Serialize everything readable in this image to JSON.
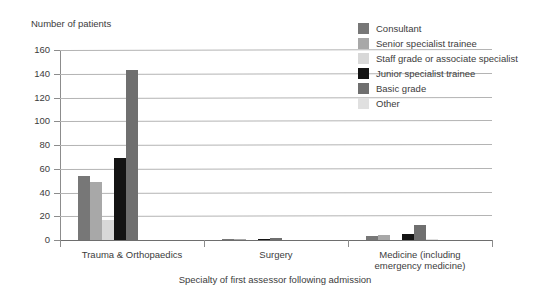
{
  "chart_data": {
    "type": "bar",
    "title": "",
    "ylabel": "Number of patients",
    "xlabel": "Specialty of first assessor following admission",
    "categories": [
      "Trauma & Orthopaedics",
      "Surgery",
      "Medicine (including emergency medicine)"
    ],
    "category_lines": [
      [
        "Trauma & Orthopaedics"
      ],
      [
        "Surgery"
      ],
      [
        "Medicine (including",
        "emergency medicine)"
      ]
    ],
    "series": [
      {
        "name": "Consultant",
        "color": "#777777",
        "values": [
          54,
          1,
          3
        ]
      },
      {
        "name": "Senior specialist trainee",
        "color": "#a8a8a8",
        "values": [
          49,
          1,
          4
        ]
      },
      {
        "name": "Staff grade or associate specialist",
        "color": "#d8d8d8",
        "values": [
          17,
          0,
          0
        ]
      },
      {
        "name": "Junior specialist trainee",
        "color": "#141414",
        "values": [
          69,
          1,
          5
        ]
      },
      {
        "name": "Basic grade",
        "color": "#6f6f6f",
        "values": [
          143,
          2,
          13
        ]
      },
      {
        "name": "Other",
        "color": "#e0e0e0",
        "values": [
          0,
          0,
          1
        ]
      }
    ],
    "ylim": [
      0,
      160
    ],
    "yticks": [
      0,
      20,
      40,
      60,
      80,
      100,
      120,
      140,
      160
    ],
    "ytick_labels": [
      "0",
      "20",
      "40",
      "60",
      "80",
      "100",
      "120",
      "140",
      "160"
    ],
    "grid": true,
    "legend_position": "top-right"
  },
  "legend": {
    "items": [
      {
        "label": "Consultant"
      },
      {
        "label": "Senior specialist trainee"
      },
      {
        "label": "Staff grade or associate specialist"
      },
      {
        "label": "Junior specialist trainee"
      },
      {
        "label": "Basic grade"
      },
      {
        "label": "Other"
      }
    ]
  }
}
